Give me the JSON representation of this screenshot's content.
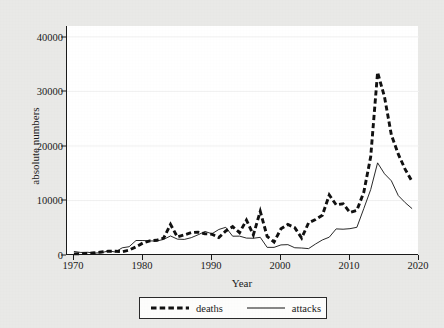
{
  "chart_data": {
    "type": "line",
    "title": "",
    "xlabel": "Year",
    "ylabel": "absolute numbers",
    "xlim": [
      1969,
      2020
    ],
    "ylim": [
      0,
      42000
    ],
    "grid": true,
    "legend_position": "bottom-center",
    "x_ticks": [
      1970,
      1980,
      1990,
      2000,
      2010,
      2020
    ],
    "y_ticks": [
      0,
      10000,
      20000,
      30000,
      40000
    ],
    "x": [
      1970,
      1971,
      1972,
      1973,
      1974,
      1975,
      1976,
      1977,
      1978,
      1979,
      1980,
      1981,
      1982,
      1983,
      1984,
      1985,
      1986,
      1987,
      1988,
      1989,
      1990,
      1991,
      1992,
      1993,
      1994,
      1995,
      1996,
      1997,
      1998,
      1999,
      2000,
      2001,
      2002,
      2003,
      2004,
      2005,
      2006,
      2007,
      2008,
      2009,
      2010,
      2011,
      2012,
      2013,
      2014,
      2015,
      2016,
      2017,
      2018,
      2019
    ],
    "series": [
      {
        "name": "deaths",
        "style": "dashed",
        "color": "#111111",
        "values": [
          200,
          250,
          300,
          400,
          550,
          700,
          700,
          600,
          900,
          1500,
          2200,
          2600,
          2700,
          3100,
          5600,
          3300,
          3700,
          4100,
          4200,
          3900,
          3800,
          3200,
          4400,
          5200,
          4100,
          6400,
          3700,
          8000,
          3400,
          2400,
          4800,
          5600,
          5000,
          3100,
          5900,
          6500,
          7300,
          11000,
          9200,
          9400,
          7800,
          8200,
          11500,
          18000,
          33500,
          29000,
          22000,
          18500,
          15700,
          13500
        ]
      },
      {
        "name": "attacks",
        "style": "solid",
        "color": "#111111",
        "values": [
          650,
          470,
          500,
          350,
          430,
          740,
          560,
          1320,
          1520,
          2660,
          2660,
          2590,
          2550,
          2870,
          3490,
          2910,
          2860,
          3180,
          3710,
          4320,
          3890,
          4680,
          5080,
          3450,
          3460,
          3100,
          3070,
          3240,
          1400,
          1400,
          1850,
          1900,
          1330,
          1280,
          1170,
          2010,
          2760,
          3270,
          4790,
          4730,
          4830,
          5080,
          8500,
          12000,
          16900,
          14900,
          13600,
          10900,
          9600,
          8500
        ]
      }
    ]
  },
  "legend": {
    "entries": [
      {
        "label": "deaths",
        "style": "dashed"
      },
      {
        "label": "attacks",
        "style": "solid"
      }
    ]
  },
  "axes": {
    "y_tick_labels": [
      "40000",
      "30000",
      "20000",
      "10000",
      "0"
    ],
    "x_tick_labels": [
      "1970",
      "1980",
      "1990",
      "2000",
      "2010",
      "2020"
    ],
    "y_axis_title": "absolute numbers",
    "x_axis_title": "Year"
  }
}
